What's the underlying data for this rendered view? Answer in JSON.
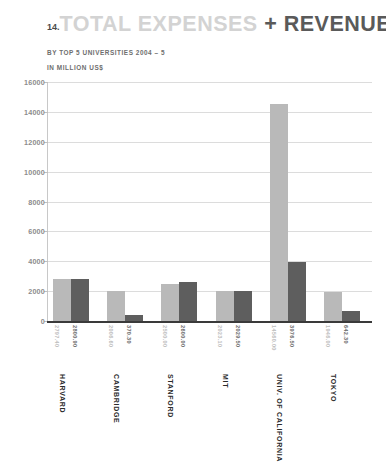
{
  "header": {
    "number": "14.",
    "title_light": "TOTAL EXPENSES",
    "title_plus": "+",
    "title_dark": "REVENUE",
    "subtitle": "BY TOP 5 UNIVERSITIES 2004 – 5",
    "units": "IN MILLION US$"
  },
  "colors": {
    "series_expenses": "#b9b9b9",
    "series_revenue": "#5e5e5e",
    "title_light": "#d3d3d3",
    "title_dark": "#5a5a5a",
    "gridline": "#dcdcdc",
    "axis": "#3a3a3a"
  },
  "chart_data": {
    "type": "bar",
    "subtitle": "BY TOP 5 UNIVERSITIES 2004 – 5",
    "xlabel": "",
    "ylabel": "IN MILLION US$",
    "ylim": [
      0,
      16000
    ],
    "yticks": [
      0,
      2000,
      4000,
      6000,
      8000,
      10000,
      12000,
      14000,
      16000
    ],
    "ytick_labels": [
      "0",
      "2000",
      "4000",
      "6000",
      "8000",
      "10000",
      "12000",
      "14000",
      "16000"
    ],
    "grid": true,
    "legend": "none",
    "categories": [
      "HARVARD",
      "CAMBRIDGE",
      "STANFORD",
      "MIT",
      "UNIV. OF CALIFORNIA",
      "TOKYO"
    ],
    "series": [
      {
        "name": "TOTAL EXPENSES",
        "color": "#b9b9b9",
        "values": [
          2797.4,
          2006.6,
          2500.0,
          2023.1,
          14560.0,
          1946.0
        ],
        "labels": [
          "2797.40",
          "2006.60",
          "2500.00",
          "2023.10",
          "14560.00",
          "1946.00"
        ]
      },
      {
        "name": "REVENUE",
        "color": "#5e5e5e",
        "values": [
          2800.9,
          370.3,
          2600.0,
          2029.5,
          3976.5,
          642.3
        ],
        "labels": [
          "2800.90",
          "370.30",
          "2600.00",
          "2029.50",
          "3976.50",
          "642.30"
        ]
      }
    ]
  }
}
